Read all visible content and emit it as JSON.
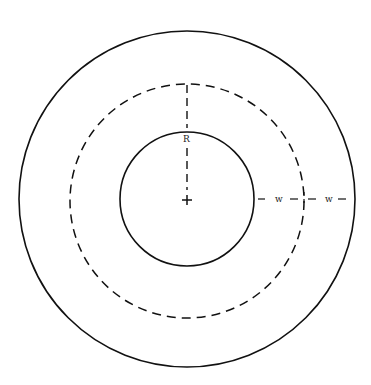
{
  "diagram": {
    "labels": {
      "radius": "R",
      "width_right_inner": "w",
      "width_right_outer": "w"
    },
    "center_marker": "+",
    "circles": [
      {
        "name": "outer-circle",
        "style": "solid"
      },
      {
        "name": "middle-circle",
        "style": "dashed"
      },
      {
        "name": "inner-circle",
        "style": "solid"
      }
    ],
    "colors": {
      "stroke": "#111111",
      "background": "#ffffff"
    }
  }
}
